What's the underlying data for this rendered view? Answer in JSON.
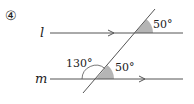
{
  "problem_number": "④",
  "lines": {
    "l": {
      "label": "l",
      "arrow": "right"
    },
    "m": {
      "label": "m",
      "arrow": "right"
    },
    "transversal": {
      "label": ""
    }
  },
  "angles": {
    "top_right": "50°",
    "bottom_left": "130°",
    "bottom_right": "50°"
  },
  "colors": {
    "line": "#555555",
    "shade": "#b5b5b5",
    "text": "#222222"
  }
}
